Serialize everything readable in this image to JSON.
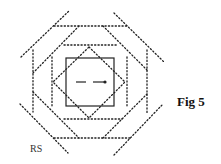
{
  "figure": {
    "caption": "Fig 5",
    "credit": "RS",
    "line_color": "#222222"
  }
}
